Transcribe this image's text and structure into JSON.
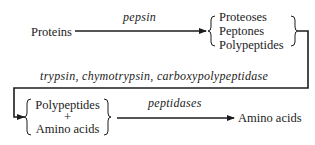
{
  "diagram": {
    "nodes": {
      "proteins": "Proteins",
      "intermediate_group": [
        "Proteoses",
        "Peptones",
        "Polypeptides"
      ],
      "second_group": [
        "Polypeptides",
        "+",
        "Amino acids"
      ],
      "final": "Amino acids"
    },
    "edges": {
      "step1_enzyme": "pepsin",
      "step2_enzymes": "trypsin, chymotrypsin, carboxypolypeptidase",
      "step3_enzyme": "peptidases"
    },
    "colors": {
      "ink": "#1c1c1c",
      "background": "#ffffff"
    }
  }
}
